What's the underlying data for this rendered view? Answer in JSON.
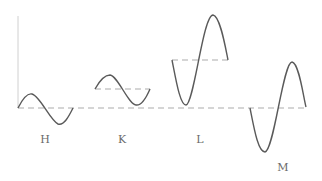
{
  "diagram": {
    "colors": {
      "wave": "#5a5a5a",
      "baseline": "#c8c8c8",
      "axis": "#d0d0d0",
      "label": "#6a6a6a"
    },
    "waves": [
      {
        "id": "H",
        "label": "H",
        "note": "one cycle centered on baseline, small amplitude"
      },
      {
        "id": "K",
        "label": "K",
        "note": "one cycle with raised midline, small amplitude"
      },
      {
        "id": "L",
        "label": "L",
        "note": "one cycle with raised midline, large amplitude, starting downward"
      },
      {
        "id": "M",
        "label": "M",
        "note": "one cycle centered on baseline, large amplitude, starting downward"
      }
    ]
  }
}
